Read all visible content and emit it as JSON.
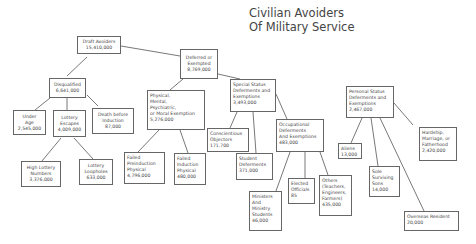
{
  "title": {
    "line1": "Civilian Avoiders",
    "line2": "Of Military Service"
  },
  "nodes": {
    "draft_avoiders": {
      "label": "Draft Avoiders",
      "value": "15,410,000"
    },
    "deferred_exempted": {
      "label1": "Deferred or",
      "label2": "Exempted",
      "value": "8,769,000"
    },
    "disqualified": {
      "label": "Disqualified",
      "value": "6,641,000"
    },
    "under_age": {
      "label1": "Under",
      "label2": "Age",
      "value": "2,545,000"
    },
    "lottery_escapes": {
      "label1": "Lottery",
      "label2": "Escapes",
      "value": "4,009,000"
    },
    "death_before_induction": {
      "label1": "Death before",
      "label2": "Induction",
      "value": "87,000"
    },
    "high_lottery_numbers": {
      "label1": "High Lottery",
      "label2": "Numbers",
      "value": "3,376,000"
    },
    "lottery_loopholes": {
      "label1": "Lottery",
      "label2": "Loopholes",
      "value": "633,000"
    },
    "physical_mental": {
      "label1": "Physical,",
      "label2": "Mental,",
      "label3": "Psychiatric,",
      "label4": "or Moral Exemption",
      "value": "5,276,000"
    },
    "failed_preinduction": {
      "label1": "Failed",
      "label2": "Preinduction",
      "label3": "Physical",
      "value": "4,796,000"
    },
    "failed_induction": {
      "label1": "Failed",
      "label2": "Induction",
      "label3": "Physical",
      "value": "480,000"
    },
    "special_status": {
      "label1": "Special Status",
      "label2": "Deferments and",
      "label3": "Exemptions",
      "value": "3,493,000"
    },
    "conscientious_objectors": {
      "label1": "Conscientious",
      "label2": "Objectors",
      "value": "171,700"
    },
    "student_deferments": {
      "label1": "Student",
      "label2": "Deferments",
      "value": "371,000"
    },
    "occupational": {
      "label1": "Occupational",
      "label2": "Deferments",
      "label3": "And Exemptions",
      "value": "483,000"
    },
    "ministers": {
      "label1": "Ministers",
      "label2": "And",
      "label3": "Ministry",
      "label4": "Students",
      "value": "46,000"
    },
    "elected_officials": {
      "label1": "Elected",
      "label2": "Officials",
      "value": "85"
    },
    "others": {
      "label1": "Others",
      "label2": "(Teachers,",
      "label3": "Engineers,",
      "label4": "Farmers)",
      "value": "435,000"
    },
    "personal_status": {
      "label1": "Personal Status",
      "label2": "Deferments and",
      "label3": "Exemptions",
      "value": "2,467,000"
    },
    "aliens": {
      "label": "Aliens",
      "value": "13,000"
    },
    "sole_surviving_sons": {
      "label1": "Sole",
      "label2": "Surviving",
      "label3": "Sons",
      "value": "14,000"
    },
    "hardship": {
      "label1": "Hardship,",
      "label2": "Marriage, or",
      "label3": "Fatherhood",
      "value": "2,420,000"
    },
    "overseas_resident": {
      "label": "Overseas Resident",
      "value": "20,000"
    }
  }
}
